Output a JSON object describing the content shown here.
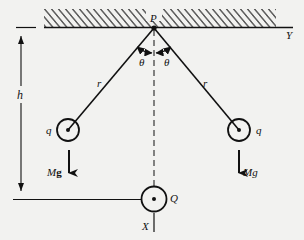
{
  "diagram": {
    "colors": {
      "background": "#f2f2f0",
      "ink": "#111111"
    },
    "labels": {
      "pivot": "P",
      "y_axis": "Y",
      "x_axis": "X",
      "angle_left": "θ",
      "angle_right": "θ",
      "string_left": "r",
      "string_right": "r",
      "height": "h",
      "charge_left": "q",
      "charge_right": "q",
      "charge_bottom": "Q",
      "weight_left_mass": "M",
      "weight_left_g": "g",
      "weight_right": "Mg"
    },
    "elements": {
      "ceiling": "hatched support surface",
      "pivot_point": "P",
      "strings": [
        "left string length r",
        "right string length r"
      ],
      "bobs": [
        "left bob charge q",
        "right bob charge q"
      ],
      "fixed_charge": "Q at distance h below P",
      "forces": [
        "Mg downward on left bob",
        "Mg downward on right bob"
      ]
    }
  }
}
